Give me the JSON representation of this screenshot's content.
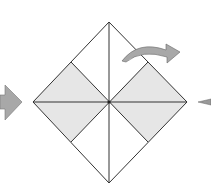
{
  "diagram": {
    "type": "origami-fold-step",
    "colors": {
      "background": "#ffffff",
      "line": "#333333",
      "shaded": "#e6e6e6",
      "arrow": "#a8a8a8",
      "arrow_stroke": "#666666"
    },
    "square": {
      "top": [
        109,
        22
      ],
      "right": [
        187,
        102
      ],
      "bottom": [
        109,
        183
      ],
      "left": [
        33,
        102
      ],
      "center": [
        109,
        102
      ]
    },
    "shaded_regions": [
      "left-half-band",
      "right-half-band"
    ],
    "arrows": [
      {
        "name": "push-arrow-left",
        "direction": "right"
      },
      {
        "name": "fold-over-arrow",
        "direction": "right-curve"
      },
      {
        "name": "inward-arrow-right",
        "direction": "left"
      }
    ]
  }
}
